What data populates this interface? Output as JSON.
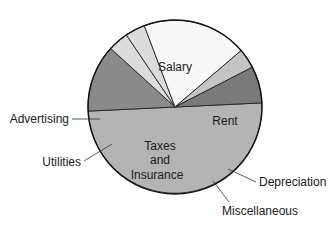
{
  "chart_data": {
    "type": "pie",
    "title": "",
    "center": [
      175,
      107
    ],
    "radius": 87,
    "start_angle_deg": -2.7,
    "direction": "clockwise",
    "slices": [
      {
        "label": "Salary",
        "value": 50.0,
        "color": "#b4b4b4",
        "label_inside": true
      },
      {
        "label": "Rent",
        "value": 12.5,
        "color": "#8a8a8a",
        "label_inside": true
      },
      {
        "label": "Depreciation",
        "value": 3.8,
        "color": "#dcdcdc",
        "label_inside": false
      },
      {
        "label": "Miscellaneous",
        "value": 3.7,
        "color": "#dcdcdc",
        "label_inside": false
      },
      {
        "label": "Taxes and Insurance",
        "value": 19.5,
        "color": "#f8f8f8",
        "label_inside": true
      },
      {
        "label": "Utilities",
        "value": 3.7,
        "color": "#c4c4c4",
        "label_inside": false
      },
      {
        "label": "Advertising",
        "value": 6.8,
        "color": "#7a7a7a",
        "label_inside": false
      }
    ],
    "legend": "none (labels placed directly on/near slices)"
  },
  "labels": {
    "salary": "Salary",
    "rent": "Rent",
    "taxes_line1": "Taxes",
    "taxes_line2": "and",
    "taxes_line3": "Insurance",
    "advertising": "Advertising",
    "utilities": "Utilities",
    "depreciation": "Depreciation",
    "miscellaneous": "Miscellaneous"
  }
}
